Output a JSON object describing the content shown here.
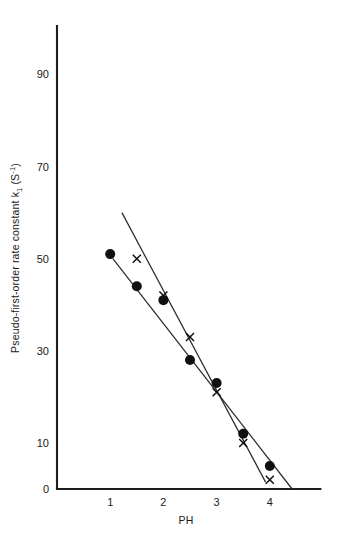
{
  "chart_data": {
    "type": "scatter",
    "title": "",
    "xlabel": "PH",
    "ylabel": "Pseudo-first-order rate constant k",
    "ylabel_sub": "1",
    "ylabel_units_open": " (S",
    "ylabel_units_sup": "-1",
    "ylabel_units_close": ")",
    "xlim": [
      0,
      4.95
    ],
    "ylim": [
      0,
      95
    ],
    "xticks": [
      1,
      2,
      3,
      4
    ],
    "xticklabels": [
      "1",
      "2",
      "3",
      "4"
    ],
    "yticks": [
      0,
      10,
      30,
      50,
      70,
      90
    ],
    "yticklabels": [
      "0",
      "10",
      "30",
      "50",
      "70",
      "90"
    ],
    "grid": false,
    "legend": "none",
    "series": [
      {
        "name": "filled-circle-series",
        "marker": "circle",
        "x": [
          1.0,
          1.5,
          2.0,
          2.5,
          3.0,
          3.5,
          4.0
        ],
        "values": [
          51,
          44,
          41,
          28,
          23,
          12,
          5
        ]
      },
      {
        "name": "cross-series",
        "marker": "cross",
        "x": [
          1.5,
          2.0,
          2.5,
          3.0,
          3.5,
          4.0
        ],
        "values": [
          50,
          42,
          33,
          21,
          10,
          2
        ]
      }
    ],
    "fit_lines": [
      {
        "name": "cross-fit-line",
        "x_start": 1.22,
        "y_start": 60,
        "x_end": 3.92,
        "y_end": 1.5
      },
      {
        "name": "circle-fit-line",
        "x_start": 1.05,
        "y_start": 50,
        "x_end": 4.42,
        "y_end": 0
      }
    ]
  }
}
